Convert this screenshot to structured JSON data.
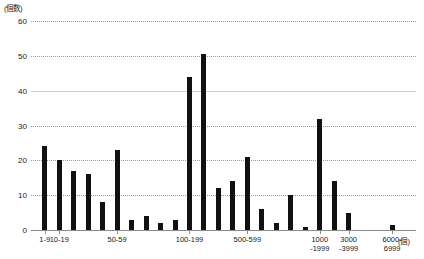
{
  "chart_data": {
    "type": "bar",
    "title": "",
    "subtitle": "",
    "xlabel": "(個)",
    "ylabel": "(個数)",
    "ylim": [
      0,
      60
    ],
    "yticks": [
      0,
      10,
      20,
      30,
      40,
      50,
      60
    ],
    "ytick_labels": [
      "0",
      "10",
      "20",
      "30",
      "40",
      "50",
      "60"
    ],
    "grid": true,
    "legend": false,
    "bar_color": "#111111",
    "grid_color": "#9a9a9a",
    "axis_color": "#8c8c8c",
    "categories": [
      "1-9",
      "10-19",
      "20-29",
      "30-39",
      "40-49",
      "50-59",
      "60-69",
      "70-79",
      "80-89",
      "90-99",
      "100-199",
      "200-299",
      "300-399",
      "400-499",
      "500-599",
      "600-699",
      "700-799",
      "800-899",
      "900-999",
      "1000-1999",
      "2000-2999",
      "3000-3999",
      "4000-4999",
      "5000-5999",
      "6000-6999"
    ],
    "values": [
      24,
      20,
      17,
      16,
      8,
      23,
      3,
      4,
      2,
      3,
      44,
      50.5,
      12,
      14,
      21,
      6,
      2,
      10,
      1,
      32,
      14,
      5,
      0,
      0,
      1.5
    ],
    "tick_label_categories": [
      "1-9",
      "10-19",
      "50-59",
      "100-199",
      "500-599",
      "1000\n-1999",
      "3000\n-3999",
      "6000-6999"
    ],
    "annotations": []
  },
  "axis": {
    "y_unit": "(個数)",
    "x_unit": "(個)"
  }
}
